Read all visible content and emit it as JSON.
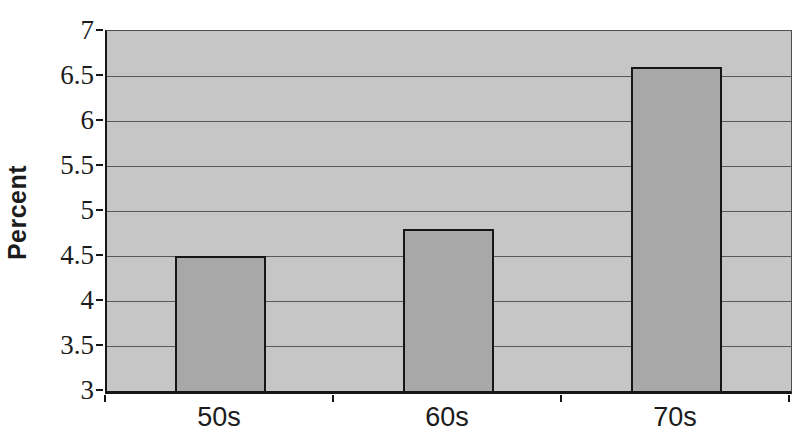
{
  "chart_data": {
    "type": "bar",
    "categories": [
      "50s",
      "60s",
      "70s"
    ],
    "values": [
      4.5,
      4.8,
      6.6
    ],
    "title": "",
    "xlabel": "",
    "ylabel": "Percent",
    "ylim": [
      3,
      7
    ],
    "ytick_step": 0.5,
    "grid": "horizontal",
    "legend": "none",
    "bar_width_fraction": 0.4
  },
  "colors": {
    "page_background": "#ffffff",
    "plot_background": "#c6c6c6",
    "bar_fill": "#a8a8a8",
    "bar_border": "#161616",
    "gridline": "#585858",
    "axis": "#161616",
    "text": "#1c1c1c"
  }
}
